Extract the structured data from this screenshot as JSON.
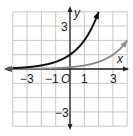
{
  "chart_data": {
    "type": "line",
    "title": "",
    "xlabel": "x",
    "ylabel": "y",
    "xlim": [
      -4,
      4
    ],
    "ylim": [
      -4,
      4
    ],
    "grid": true,
    "x_ticks": [
      {
        "value": -3,
        "label": "−3"
      },
      {
        "value": -1,
        "label": "−1"
      },
      {
        "value": 0,
        "label": "O"
      },
      {
        "value": 1,
        "label": "1"
      },
      {
        "value": 3,
        "label": "3"
      }
    ],
    "y_ticks": [
      {
        "value": 3,
        "label": "3"
      },
      {
        "value": -3,
        "label": "−3"
      }
    ],
    "series": [
      {
        "name": "black-curve",
        "color": "#111111",
        "function": "2^x",
        "x": [
          -4,
          -3,
          -2,
          -1,
          0,
          1,
          2
        ],
        "y": [
          0.0625,
          0.125,
          0.25,
          0.5,
          1,
          2,
          4
        ]
      },
      {
        "name": "gray-curve",
        "color": "#8a8a8a",
        "function": "2^(x-3)",
        "x": [
          -4,
          -3,
          -2,
          -1,
          0,
          1,
          2,
          3,
          4
        ],
        "y": [
          0.0078,
          0.0156,
          0.03125,
          0.0625,
          0.125,
          0.25,
          0.5,
          1,
          2
        ]
      }
    ],
    "legend": null
  },
  "labels": {
    "x_axis": "x",
    "y_axis": "y",
    "tick_neg3": "−3",
    "tick_neg1": "−1",
    "origin": "O",
    "tick_1": "1",
    "tick_3": "3",
    "ytick_3": "3",
    "ytick_neg3": "−3"
  }
}
